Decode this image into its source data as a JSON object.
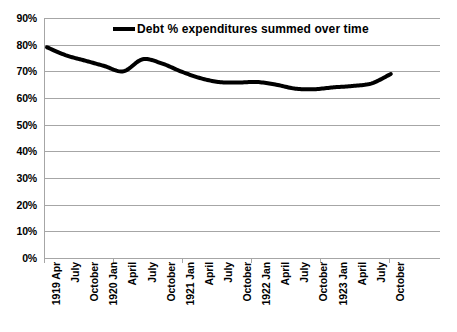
{
  "chart_data": {
    "type": "line",
    "title": "",
    "xlabel": "",
    "ylabel": "",
    "ylim": [
      0,
      90
    ],
    "ytick_labels": [
      "90%",
      "80%",
      "70%",
      "60%",
      "50%",
      "40%",
      "30%",
      "20%",
      "10%",
      "0%"
    ],
    "ytick_values": [
      90,
      80,
      70,
      60,
      50,
      40,
      30,
      20,
      10,
      0
    ],
    "grid": true,
    "legend_position": "top-center",
    "legend": [
      "Debt % expenditures summed over time"
    ],
    "line_color": "#000000",
    "gridline_color": "#a6a6a6",
    "categories": [
      "1919 Apr",
      "July",
      "October",
      "1920 Jan",
      "April",
      "July",
      "October",
      "1921 Jan",
      "April",
      "July",
      "October",
      "1922 Jan",
      "April",
      "July",
      "October",
      "1923 Jan",
      "April",
      "July",
      "October"
    ],
    "series": [
      {
        "name": "Debt % expenditures summed over time",
        "values": [
          79,
          76,
          74,
          72,
          70,
          74.5,
          73,
          70,
          67.5,
          66,
          65.8,
          66,
          65,
          63.5,
          63.3,
          64,
          64.5,
          65.5,
          69
        ]
      }
    ]
  },
  "legend": {
    "label": "Debt % expenditures summed over time",
    "marker": "line-marker"
  }
}
